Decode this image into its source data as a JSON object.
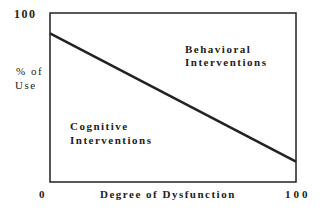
{
  "chart_data": {
    "type": "line",
    "title": "",
    "xlabel": "Degree of Dysfunction",
    "ylabel": "% of Use",
    "xlim": [
      0,
      100
    ],
    "ylim": [
      0,
      100
    ],
    "x_tick_labels": [
      "0",
      "100"
    ],
    "y_tick_labels": [
      "100"
    ],
    "grid": false,
    "series": [
      {
        "name": "Boundary",
        "x": [
          0,
          100
        ],
        "y": [
          88,
          12
        ]
      }
    ],
    "annotations": [
      {
        "text": "Behavioral Interventions",
        "region": "above line"
      },
      {
        "text": "Cognitive Interventions",
        "region": "below line"
      }
    ]
  },
  "labels": {
    "y_top": "100",
    "y_axis_line1": "% of",
    "y_axis_line2": "Use",
    "x_zero": "0",
    "x_axis": "Degree of Dysfunction",
    "x_max": "100",
    "behavioral_line1": "Behavioral",
    "behavioral_line2": "Interventions",
    "cognitive_line1": "Cognitive",
    "cognitive_line2": "Interventions"
  },
  "colors": {
    "line": "#222222",
    "frame": "#222222"
  }
}
